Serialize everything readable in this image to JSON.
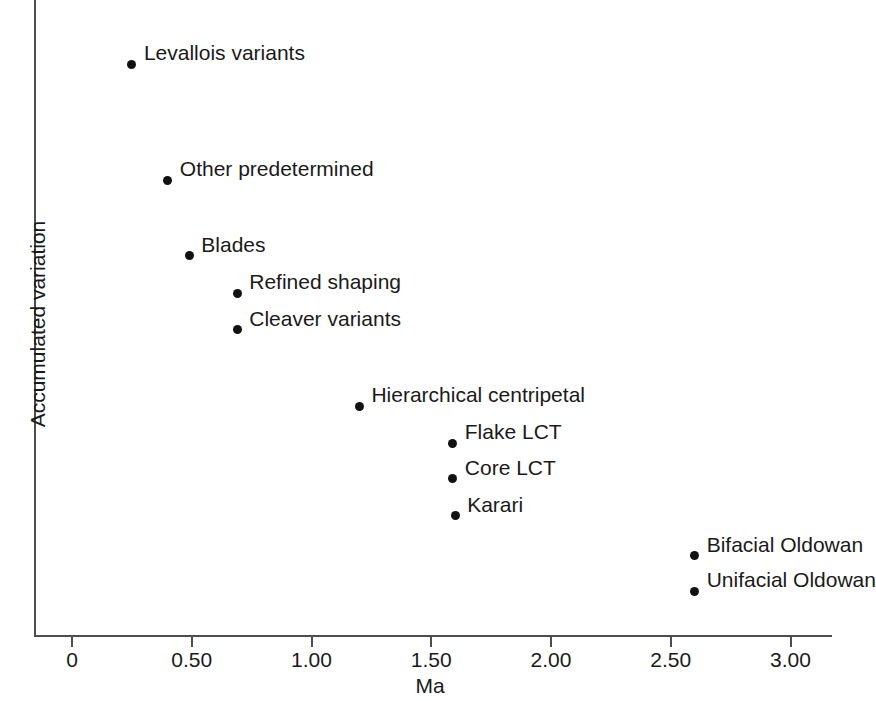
{
  "chart_data": {
    "type": "scatter",
    "title": "",
    "xlabel": "Ma",
    "ylabel": "Accumulated variation",
    "xlim": [
      0,
      3.16
    ],
    "ylim": [
      0,
      1
    ],
    "grid": false,
    "legend": "none",
    "xticks": [
      {
        "value": 0,
        "label": "0"
      },
      {
        "value": 0.5,
        "label": "0.50"
      },
      {
        "value": 1.0,
        "label": "1.00"
      },
      {
        "value": 1.5,
        "label": "1.50"
      },
      {
        "value": 2.0,
        "label": "2.00"
      },
      {
        "value": 2.5,
        "label": "2.50"
      },
      {
        "value": 3.0,
        "label": "3.00"
      }
    ],
    "yticks": [],
    "points": [
      {
        "label": "Levallois variants",
        "x": 0.25,
        "y": 0.91,
        "label_dx": 12,
        "label_dy": -14
      },
      {
        "label": "Other predetermined",
        "x": 0.4,
        "y": 0.725,
        "label_dx": 12,
        "label_dy": -14
      },
      {
        "label": "Blades",
        "x": 0.49,
        "y": 0.605,
        "label_dx": 12,
        "label_dy": -14
      },
      {
        "label": "Refined shaping",
        "x": 0.69,
        "y": 0.545,
        "label_dx": 12,
        "label_dy": -14
      },
      {
        "label": "Cleaver variants",
        "x": 0.69,
        "y": 0.487,
        "label_dx": 12,
        "label_dy": -14
      },
      {
        "label": "Hierarchical centripetal",
        "x": 1.2,
        "y": 0.365,
        "label_dx": 12,
        "label_dy": -14
      },
      {
        "label": "Flake LCT",
        "x": 1.59,
        "y": 0.306,
        "label_dx": 12,
        "label_dy": -14
      },
      {
        "label": "Core LCT",
        "x": 1.59,
        "y": 0.249,
        "label_dx": 12,
        "label_dy": -14
      },
      {
        "label": "Karari",
        "x": 1.6,
        "y": 0.19,
        "label_dx": 12,
        "label_dy": -14
      },
      {
        "label": "Bifacial Oldowan",
        "x": 2.6,
        "y": 0.126,
        "label_dx": 12,
        "label_dy": -14
      },
      {
        "label": "Unifacial Oldowan",
        "x": 2.6,
        "y": 0.07,
        "label_dx": 12,
        "label_dy": -14
      }
    ]
  },
  "axes": {
    "x_title": "Ma",
    "y_title": "Accumulated variation"
  },
  "colors": {
    "point": "#111111",
    "axis": "#4d4d4d",
    "text": "#1a1a1a",
    "background": "#ffffff"
  }
}
